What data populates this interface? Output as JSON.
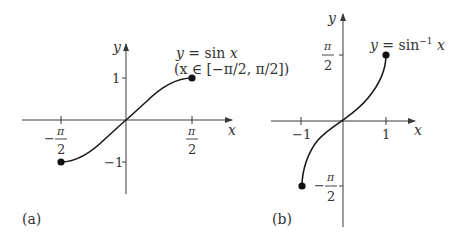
{
  "panel_a": {
    "caption": "(a)",
    "x_axis_label": "x",
    "y_axis_label": "y",
    "y_ticks": [
      {
        "label": "1",
        "value": 1
      },
      {
        "label": "−1",
        "value": -1
      }
    ],
    "x_ticks": [
      {
        "sign": "−",
        "num": "π",
        "den": "2",
        "value": "-pi/2"
      },
      {
        "sign": "",
        "num": "π",
        "den": "2",
        "value": "pi/2"
      }
    ],
    "annotation_line1": "y = sin x",
    "annotation_line2": "(x ∈ [−π/2, π/2])",
    "endpoints": [
      {
        "x": "-pi/2",
        "y": -1
      },
      {
        "x": "pi/2",
        "y": 1
      }
    ]
  },
  "panel_b": {
    "caption": "(b)",
    "x_axis_label": "x",
    "y_axis_label": "y",
    "x_ticks": [
      {
        "label": "−1",
        "value": -1
      },
      {
        "label": "1",
        "value": 1
      }
    ],
    "y_ticks": [
      {
        "sign": "",
        "num": "π",
        "den": "2",
        "value": "pi/2"
      },
      {
        "sign": "−",
        "num": "π",
        "den": "2",
        "value": "-pi/2"
      }
    ],
    "annotation": "y = sin⁻¹ x",
    "endpoints": [
      {
        "x": -1,
        "y": "-pi/2"
      },
      {
        "x": 1,
        "y": "pi/2"
      }
    ]
  },
  "colors": {
    "ink": "#1a1a1a",
    "axis": "#3a3a3a",
    "background": "#ffffff"
  }
}
